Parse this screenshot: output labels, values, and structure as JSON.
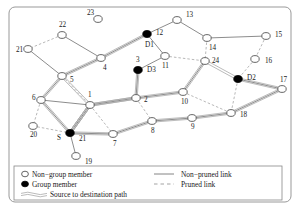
{
  "figure": {
    "type": "network-diagram",
    "canvas": {
      "width": 301,
      "height": 214
    },
    "frame": {
      "x": 9,
      "y": 7,
      "width": 282,
      "height": 195,
      "radius": 6,
      "stroke": "#999999"
    }
  },
  "colors": {
    "background": "#ffffff",
    "node_outline": "#555555",
    "node_fill_nongroup": "#ffffff",
    "node_fill_group": "#000000",
    "link_nonpruned": "#777777",
    "link_pruned": "#999999",
    "path": "#aaaaaa",
    "text": "#1a1a1a",
    "legend_border": "#888888"
  },
  "nodes": [
    {
      "id": "23",
      "label": "23",
      "x": 98,
      "y": 19,
      "type": "non-group",
      "label_dx": -11,
      "label_dy": -4
    },
    {
      "id": "13",
      "label": "13",
      "x": 177,
      "y": 20,
      "type": "non-group",
      "label_dx": 9,
      "label_dy": -3
    },
    {
      "id": "22",
      "label": "22",
      "x": 62,
      "y": 35,
      "type": "non-group",
      "label_dx": -3,
      "label_dy": -8
    },
    {
      "id": "12",
      "label": "12",
      "x": 147,
      "y": 34,
      "type": "group",
      "group_label": "D1",
      "label_dx": 9,
      "label_dy": 1,
      "group_label_dx": -2,
      "group_label_dy": 13
    },
    {
      "id": "15",
      "label": "15",
      "x": 266,
      "y": 36,
      "type": "non-group",
      "label_dx": 9,
      "label_dy": 1
    },
    {
      "id": "14",
      "label": "14",
      "x": 207,
      "y": 38,
      "type": "non-group",
      "label_dx": 2,
      "label_dy": 12
    },
    {
      "id": "21",
      "label": "21",
      "x": 28,
      "y": 49,
      "type": "non-group",
      "label_dx": -12,
      "label_dy": 3
    },
    {
      "id": "11",
      "label": "11",
      "x": 165,
      "y": 56,
      "type": "non-group",
      "label_dx": -3,
      "label_dy": 12
    },
    {
      "id": "4",
      "label": "4",
      "x": 101,
      "y": 58,
      "type": "non-group",
      "label_dx": 2,
      "label_dy": 12
    },
    {
      "id": "24",
      "label": "24",
      "x": 205,
      "y": 61,
      "type": "non-group",
      "label_dx": 7,
      "label_dy": 2
    },
    {
      "id": "16",
      "label": "16",
      "x": 255,
      "y": 59,
      "type": "non-group",
      "label_dx": 10,
      "label_dy": 4
    },
    {
      "id": "3",
      "label": "3",
      "x": 138,
      "y": 70,
      "type": "group",
      "group_label": "D3",
      "label_dx": -2,
      "label_dy": -8,
      "group_label_dx": 9,
      "group_label_dy": 2
    },
    {
      "id": "5",
      "label": "5",
      "x": 62,
      "y": 76,
      "type": "non-group",
      "label_dx": 8,
      "label_dy": 6
    },
    {
      "id": "D2",
      "label": "D2",
      "x": 238,
      "y": 79,
      "type": "group",
      "group_label": "D2",
      "label_dx": 9,
      "label_dy": 1,
      "is_named": true
    },
    {
      "id": "10",
      "label": "10",
      "x": 183,
      "y": 92,
      "type": "non-group",
      "label_dx": -2,
      "label_dy": 12
    },
    {
      "id": "17",
      "label": "17",
      "x": 282,
      "y": 89,
      "type": "non-group",
      "label_dx": -2,
      "label_dy": -7
    },
    {
      "id": "6",
      "label": "6",
      "x": 41,
      "y": 100,
      "type": "non-group",
      "label_dx": -9,
      "label_dy": 0
    },
    {
      "id": "2",
      "label": "2",
      "x": 136,
      "y": 98,
      "type": "non-group",
      "label_dx": 8,
      "label_dy": 4
    },
    {
      "id": "1",
      "label": "1",
      "x": 90,
      "y": 105,
      "type": "non-group",
      "label_dx": -2,
      "label_dy": -8
    },
    {
      "id": "18",
      "label": "18",
      "x": 231,
      "y": 113,
      "type": "non-group",
      "label_dx": 9,
      "label_dy": 4
    },
    {
      "id": "9",
      "label": "9",
      "x": 192,
      "y": 118,
      "type": "non-group",
      "label_dx": -1,
      "label_dy": 11
    },
    {
      "id": "20",
      "label": "20",
      "x": 33,
      "y": 126,
      "type": "non-group",
      "label_dx": -3,
      "label_dy": 11
    },
    {
      "id": "8",
      "label": "8",
      "x": 152,
      "y": 121,
      "type": "non-group",
      "label_dx": -1,
      "label_dy": 12
    },
    {
      "id": "7",
      "label": "7",
      "x": 113,
      "y": 134,
      "type": "non-group",
      "label_dx": 0,
      "label_dy": 12
    },
    {
      "id": "S",
      "label": "21",
      "x": 70,
      "y": 133,
      "type": "group",
      "group_label": "S",
      "label_dx": 9,
      "label_dy": 8,
      "group_label_dx": -13,
      "group_label_dy": 7
    },
    {
      "id": "19",
      "label": "19",
      "x": 76,
      "y": 156,
      "type": "non-group",
      "label_dx": 9,
      "label_dy": 8
    }
  ],
  "links": [
    {
      "from": "22",
      "to": "21",
      "style": "pruned"
    },
    {
      "from": "22",
      "to": "4",
      "style": "non-pruned"
    },
    {
      "from": "21",
      "to": "5",
      "style": "non-pruned"
    },
    {
      "from": "4",
      "to": "5",
      "style": "non-pruned"
    },
    {
      "from": "4",
      "to": "12",
      "style": "non-pruned"
    },
    {
      "from": "12",
      "to": "13",
      "style": "non-pruned"
    },
    {
      "from": "12",
      "to": "11",
      "style": "non-pruned"
    },
    {
      "from": "13",
      "to": "14",
      "style": "non-pruned"
    },
    {
      "from": "14",
      "to": "15",
      "style": "non-pruned"
    },
    {
      "from": "14",
      "to": "24",
      "style": "pruned"
    },
    {
      "from": "11",
      "to": "24",
      "style": "pruned"
    },
    {
      "from": "11",
      "to": "3",
      "style": "non-pruned"
    },
    {
      "from": "15",
      "to": "16",
      "style": "pruned"
    },
    {
      "from": "16",
      "to": "D2",
      "style": "pruned"
    },
    {
      "from": "24",
      "to": "10",
      "style": "non-pruned"
    },
    {
      "from": "5",
      "to": "6",
      "style": "non-pruned"
    },
    {
      "from": "5",
      "to": "1",
      "style": "pruned"
    },
    {
      "from": "6",
      "to": "1",
      "style": "non-pruned"
    },
    {
      "from": "6",
      "to": "20",
      "style": "pruned"
    },
    {
      "from": "20",
      "to": "S",
      "style": "pruned"
    },
    {
      "from": "1",
      "to": "2",
      "style": "non-pruned"
    },
    {
      "from": "1",
      "to": "7",
      "style": "pruned"
    },
    {
      "from": "2",
      "to": "3",
      "style": "non-pruned"
    },
    {
      "from": "2",
      "to": "10",
      "style": "non-pruned"
    },
    {
      "from": "2",
      "to": "8",
      "style": "pruned"
    },
    {
      "from": "10",
      "to": "18",
      "style": "pruned"
    },
    {
      "from": "D2",
      "to": "18",
      "style": "pruned"
    },
    {
      "from": "D2",
      "to": "17",
      "style": "non-pruned"
    },
    {
      "from": "17",
      "to": "18",
      "style": "non-pruned"
    },
    {
      "from": "7",
      "to": "8",
      "style": "non-pruned"
    },
    {
      "from": "8",
      "to": "9",
      "style": "non-pruned"
    },
    {
      "from": "9",
      "to": "18",
      "style": "non-pruned"
    },
    {
      "from": "S",
      "to": "7",
      "style": "non-pruned"
    },
    {
      "from": "S",
      "to": "19",
      "style": "non-pruned"
    },
    {
      "from": "S",
      "to": "1",
      "style": "non-pruned"
    },
    {
      "from": "S",
      "to": "6",
      "style": "non-pruned"
    }
  ],
  "paths": [
    {
      "name": "path-to-D3",
      "nodes": [
        "S",
        "1",
        "2",
        "3"
      ]
    },
    {
      "name": "path-to-D1",
      "nodes": [
        "S",
        "1",
        "5",
        "4",
        "12"
      ]
    },
    {
      "name": "path-to-D2-via-10",
      "nodes": [
        "S",
        "1",
        "2",
        "10",
        "24",
        "D2"
      ]
    },
    {
      "name": "path-to-D2-via-south",
      "nodes": [
        "S",
        "7",
        "8",
        "9",
        "18",
        "17",
        "D2"
      ]
    },
    {
      "name": "path-left-loop",
      "nodes": [
        "S",
        "6",
        "5"
      ]
    }
  ],
  "legend": {
    "box": {
      "x": 14,
      "y": 166,
      "width": 268,
      "height": 34
    },
    "entries": [
      {
        "id": "non-group-member",
        "symbol": "open-circle",
        "label": "Non−group member"
      },
      {
        "id": "group-member",
        "symbol": "filled-circle",
        "label": "Group member"
      },
      {
        "id": "non-pruned-link",
        "symbol": "solid-line",
        "label": "Non−pruned link"
      },
      {
        "id": "pruned-link",
        "symbol": "dashed-line",
        "label": "Pruned link"
      },
      {
        "id": "source-to-destination-path",
        "symbol": "double-line",
        "label": "Source to destination path"
      }
    ]
  }
}
